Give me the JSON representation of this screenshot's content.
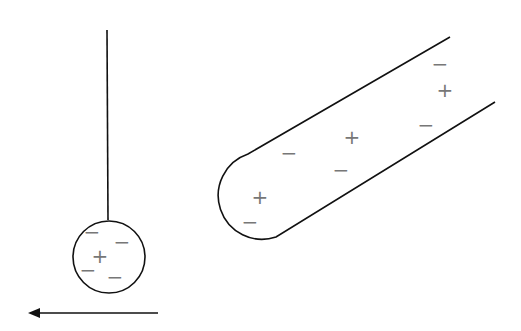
{
  "diagram": {
    "ball": {
      "charges": [
        {
          "sign": "−",
          "x": 92,
          "y": 232
        },
        {
          "sign": "−",
          "x": 122,
          "y": 242
        },
        {
          "sign": "+",
          "x": 100,
          "y": 256
        },
        {
          "sign": "−",
          "x": 88,
          "y": 270
        },
        {
          "sign": "−",
          "x": 115,
          "y": 277
        }
      ]
    },
    "rod": {
      "charges": [
        {
          "sign": "−",
          "x": 440,
          "y": 64
        },
        {
          "sign": "+",
          "x": 445,
          "y": 90
        },
        {
          "sign": "−",
          "x": 426,
          "y": 125
        },
        {
          "sign": "+",
          "x": 352,
          "y": 137
        },
        {
          "sign": "−",
          "x": 289,
          "y": 153
        },
        {
          "sign": "−",
          "x": 341,
          "y": 170
        },
        {
          "sign": "+",
          "x": 260,
          "y": 197
        },
        {
          "sign": "−",
          "x": 250,
          "y": 222
        }
      ]
    },
    "arrow": {
      "direction": "left"
    },
    "colors": {
      "line": "#111111",
      "charge": "#777777"
    }
  }
}
